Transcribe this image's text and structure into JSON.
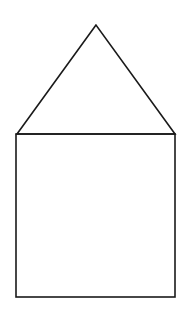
{
  "canvas": {
    "width": 190,
    "height": 316,
    "background": "#ffffff"
  },
  "style": {
    "stroke_color": "#1a1a1a",
    "stroke_width": 1.6,
    "fill": "none"
  },
  "shapes": {
    "roof": {
      "type": "triangle",
      "points": [
        [
          96,
          25
        ],
        [
          17,
          134
        ],
        [
          175,
          134
        ]
      ]
    },
    "body": {
      "type": "rectangle",
      "x": 16,
      "y": 134,
      "width": 159,
      "height": 163
    }
  }
}
